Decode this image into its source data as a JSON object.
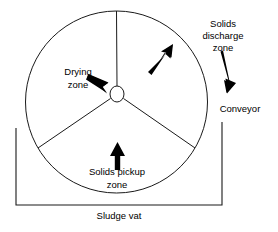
{
  "diagram": {
    "colors": {
      "line": "#1a1a1a",
      "arrow": "#000000",
      "text": "#000000",
      "background": "#ffffff"
    },
    "labels": {
      "drying_zone_line1": "Drying",
      "drying_zone_line2": "zone",
      "solids_discharge_line1": "Solids",
      "solids_discharge_line2": "discharge",
      "solids_discharge_line3": "zone",
      "conveyor": "Conveyor",
      "solids_pickup_line1": "Solids pickup",
      "solids_pickup_line2": "zone",
      "sludge_vat": "Sludge vat"
    },
    "shapes": {
      "drum": {
        "cx": 116.5,
        "cy": 102,
        "r": 91
      },
      "hub": {
        "cx": 117,
        "cy": 94,
        "rx": 7,
        "ry": 8
      },
      "vat": {
        "left": 16,
        "right": 222,
        "top_left": 128,
        "top_right": 122,
        "bottom": 205
      }
    },
    "icons": {
      "rotation_arrow": "arrow-up-right-icon",
      "drying_pointer": "arrow-down-right-icon",
      "discharge_pointer": "arrow-down-icon",
      "pickup_arrow": "arrow-up-icon"
    }
  }
}
